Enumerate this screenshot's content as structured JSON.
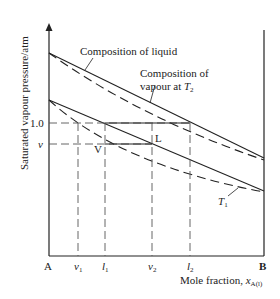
{
  "diagram": {
    "y_axis_label": "Saturated vapour pressure/atm",
    "x_axis_label": "Mole fraction, ",
    "x_axis_var": "x",
    "x_axis_sub": "A(l)",
    "y_ticks": {
      "one": "1.0",
      "v": "v"
    },
    "x_ticks": {
      "A": "A",
      "B": "B",
      "v1": "v",
      "v1_sub": "1",
      "l1": "l",
      "l1_sub": "1",
      "v2": "v",
      "v2_sub": "2",
      "l2": "l",
      "l2_sub": "2"
    },
    "points": {
      "V": "V",
      "L": "L"
    },
    "annotations": {
      "liquid": "Composition of liquid",
      "vapour_line1": "Composition of",
      "vapour_line2": "vapour at ",
      "T2": "T",
      "T2_sub": "2",
      "T1": "T",
      "T1_sub": "1"
    },
    "colors": {
      "ink": "#222222",
      "background": "#ffffff"
    }
  }
}
